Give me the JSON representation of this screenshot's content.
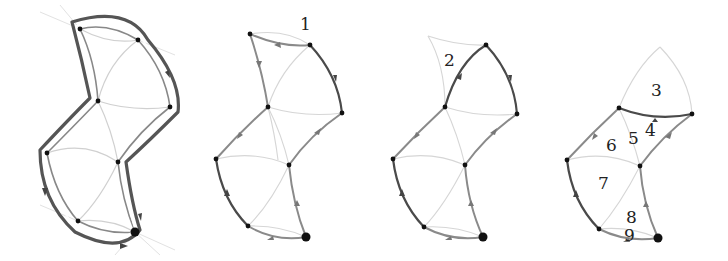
{
  "figure": {
    "panels": [
      {
        "id": "panel-1",
        "description": "Full boundary loop traced around the surface mesh",
        "labels": []
      },
      {
        "id": "panel-2",
        "description": "Step 1 removed",
        "labels": [
          {
            "text": "1",
            "x": 305,
            "y": 30
          }
        ]
      },
      {
        "id": "panel-3",
        "description": "Step 2 removed",
        "labels": [
          {
            "text": "2",
            "x": 446,
            "y": 64
          }
        ]
      },
      {
        "id": "panel-4",
        "description": "Face ordering",
        "labels": [
          {
            "text": "3",
            "x": 656,
            "y": 96
          },
          {
            "text": "4",
            "x": 650,
            "y": 136
          },
          {
            "text": "5",
            "x": 632,
            "y": 143
          },
          {
            "text": "6",
            "x": 610,
            "y": 150
          },
          {
            "text": "7",
            "x": 604,
            "y": 188
          },
          {
            "text": "8",
            "x": 630,
            "y": 220
          },
          {
            "text": "9",
            "x": 628,
            "y": 240
          }
        ]
      }
    ],
    "colors": {
      "boundary_dark": "#444444",
      "edge_mid": "#888888",
      "edge_light": "#d2d2d2",
      "vertex": "#111111"
    }
  }
}
